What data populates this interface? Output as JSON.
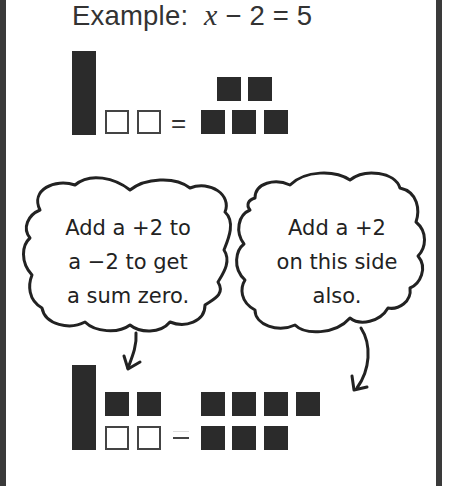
{
  "title": {
    "prefix": "Example:",
    "variable": "x",
    "rest": "− 2 = 5"
  },
  "top_model": {
    "left_side": {
      "x_bars": 1,
      "negative_units": 2
    },
    "operator": "=",
    "right_side": {
      "positive_units": 5
    }
  },
  "bubbles": [
    {
      "lines": [
        "Add a +2 to",
        "a −2 to get",
        "a sum zero."
      ]
    },
    {
      "lines": [
        "Add a +2",
        "on this side",
        "also."
      ]
    }
  ],
  "bottom_model": {
    "left_side": {
      "x_bars": 1,
      "positive_units": 2,
      "negative_units": 2
    },
    "operator": "=",
    "right_side": {
      "positive_units": 7
    }
  },
  "colors": {
    "tile_dark": "#2b2b2b",
    "border": "#3a3a3a",
    "text": "#333333"
  }
}
